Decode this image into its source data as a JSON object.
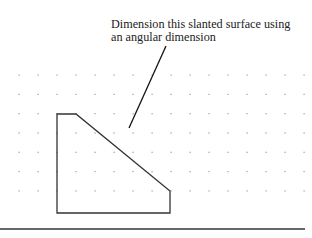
{
  "annotation": {
    "line1": "Dimension this slanted surface using",
    "line2": "an angular dimension"
  },
  "grid": {
    "x_start": 19,
    "y_start": 75,
    "spacing_x": 19,
    "spacing_y": 19.3,
    "cols": 16,
    "rows": 7,
    "dot_color": "#9a9a9a"
  },
  "shape": {
    "points": "57,114 76,114 170,191 170,213 57,213",
    "stroke": "#333333"
  },
  "leader": {
    "x1": 166,
    "y1": 46,
    "x2": 129,
    "y2": 128
  },
  "baseline": {
    "x1": 0,
    "y1": 229,
    "x2": 305,
    "y2": 229,
    "color": "#333333"
  }
}
